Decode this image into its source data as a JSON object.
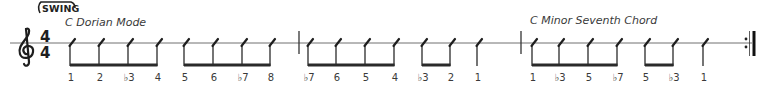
{
  "style_marking": "SWING",
  "time_signature": {
    "top": "4",
    "bottom": "4"
  },
  "sections": [
    {
      "title": "C Dorian Mode"
    },
    {
      "title": "C Minor Seventh Chord"
    }
  ],
  "notes": [
    {
      "x": 70,
      "degree": "1"
    },
    {
      "x": 99,
      "degree": "2"
    },
    {
      "x": 128,
      "degree": "♭3"
    },
    {
      "x": 157,
      "degree": "4"
    },
    {
      "x": 184,
      "degree": "5"
    },
    {
      "x": 213,
      "degree": "6"
    },
    {
      "x": 242,
      "degree": "♭7"
    },
    {
      "x": 270,
      "degree": "8"
    },
    {
      "x": 308,
      "degree": "♭7"
    },
    {
      "x": 336,
      "degree": "6"
    },
    {
      "x": 365,
      "degree": "5"
    },
    {
      "x": 394,
      "degree": "4"
    },
    {
      "x": 422,
      "degree": "♭3"
    },
    {
      "x": 450,
      "degree": "2"
    },
    {
      "x": 477,
      "degree": "1"
    },
    {
      "x": 532,
      "degree": "1"
    },
    {
      "x": 559,
      "degree": "♭3"
    },
    {
      "x": 588,
      "degree": "5"
    },
    {
      "x": 617,
      "degree": "♭7"
    },
    {
      "x": 645,
      "degree": "5"
    },
    {
      "x": 673,
      "degree": "♭3"
    },
    {
      "x": 703,
      "degree": "1"
    }
  ],
  "colors": {
    "ink": "#2a2a2a",
    "staff": "#6a6a6a",
    "text": "#3a3a3a"
  }
}
